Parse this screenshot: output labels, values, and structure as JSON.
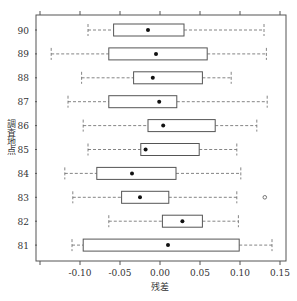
{
  "chart_data": {
    "type": "boxplot",
    "orientation": "horizontal",
    "title": "",
    "xlabel": "残差",
    "ylabel": "調査地点",
    "xlim": [
      -0.15,
      0.16
    ],
    "xticks": [
      -0.1,
      -0.05,
      0.0,
      0.05,
      0.1,
      0.15
    ],
    "xtick_labels": [
      "-0.10",
      "-0.05",
      "0.00",
      "0.05",
      "0.10",
      "0.15"
    ],
    "categories": [
      "90",
      "89",
      "88",
      "87",
      "86",
      "85",
      "84",
      "83",
      "82",
      "81"
    ],
    "series": [
      {
        "name": "90",
        "whisker_low": -0.09,
        "q1": -0.058,
        "mean": -0.015,
        "q3": 0.03,
        "whisker_high": 0.13,
        "outliers": []
      },
      {
        "name": "89",
        "whisker_low": -0.136,
        "q1": -0.064,
        "mean": -0.005,
        "q3": 0.059,
        "whisker_high": 0.133,
        "outliers": []
      },
      {
        "name": "88",
        "whisker_low": -0.098,
        "q1": -0.033,
        "mean": -0.009,
        "q3": 0.053,
        "whisker_high": 0.089,
        "outliers": []
      },
      {
        "name": "87",
        "whisker_low": -0.115,
        "q1": -0.064,
        "mean": -0.001,
        "q3": 0.021,
        "whisker_high": 0.134,
        "outliers": []
      },
      {
        "name": "86",
        "whisker_low": -0.096,
        "q1": -0.015,
        "mean": 0.004,
        "q3": 0.069,
        "whisker_high": 0.121,
        "outliers": []
      },
      {
        "name": "85",
        "whisker_low": -0.09,
        "q1": -0.024,
        "mean": -0.018,
        "q3": 0.049,
        "whisker_high": 0.096,
        "outliers": []
      },
      {
        "name": "84",
        "whisker_low": -0.119,
        "q1": -0.079,
        "mean": -0.035,
        "q3": 0.02,
        "whisker_high": 0.101,
        "outliers": []
      },
      {
        "name": "83",
        "whisker_low": -0.109,
        "q1": -0.048,
        "mean": -0.025,
        "q3": 0.011,
        "whisker_high": 0.096,
        "outliers": [
          0.131
        ]
      },
      {
        "name": "82",
        "whisker_low": -0.064,
        "q1": 0.003,
        "mean": 0.028,
        "q3": 0.053,
        "whisker_high": 0.098,
        "outliers": []
      },
      {
        "name": "81",
        "whisker_low": -0.11,
        "q1": -0.096,
        "mean": 0.01,
        "q3": 0.099,
        "whisker_high": 0.14,
        "outliers": []
      }
    ],
    "grid": false,
    "legend": null
  },
  "colors": {
    "frame": "#555555",
    "box": "#555555",
    "whisker": "#666666",
    "mean": "#111111"
  }
}
